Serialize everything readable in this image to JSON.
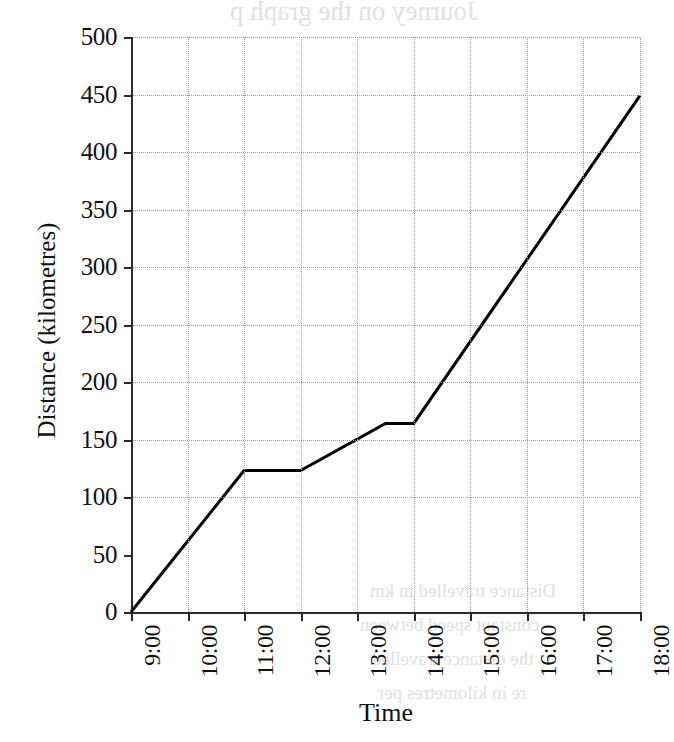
{
  "chart_data": {
    "type": "line",
    "title": "",
    "xlabel": "Time",
    "ylabel": "Distance (kilometres)",
    "xlim": [
      9,
      18
    ],
    "ylim": [
      0,
      500
    ],
    "grid": true,
    "legend": false,
    "x_tick_labels": [
      "9:00",
      "10:00",
      "11:00",
      "12:00",
      "13:00",
      "14:00",
      "15:00",
      "16:00",
      "17:00",
      "18:00"
    ],
    "x_tick_values": [
      9,
      10,
      11,
      12,
      13,
      14,
      15,
      16,
      17,
      18
    ],
    "y_tick_labels": [
      "0",
      "50",
      "100",
      "150",
      "200",
      "250",
      "300",
      "350",
      "400",
      "450",
      "500"
    ],
    "y_tick_values": [
      0,
      50,
      100,
      150,
      200,
      250,
      300,
      350,
      400,
      450,
      500
    ],
    "y_gridline_values": [
      100,
      150,
      200,
      250,
      300,
      350,
      400,
      450,
      500
    ],
    "series": [
      {
        "name": "Journey",
        "color": "#000000",
        "line_width": 3,
        "points": [
          {
            "x": 9.0,
            "label": "9:00",
            "y": 0
          },
          {
            "x": 11.0,
            "label": "11:00",
            "y": 123
          },
          {
            "x": 12.0,
            "label": "12:00",
            "y": 123
          },
          {
            "x": 13.5,
            "label": "13:30",
            "y": 164
          },
          {
            "x": 14.0,
            "label": "14:00",
            "y": 164
          },
          {
            "x": 18.0,
            "label": "18:00",
            "y": 449
          }
        ]
      }
    ]
  },
  "bleed_text": {
    "top": "Journey on the graph p",
    "line1": "Distance travelled in km",
    "line2": "constant speed between",
    "line3": "the distance travelled",
    "line4": "re in kilometres per"
  },
  "colors": {
    "axis": "#2a2a2a",
    "grid": "#9a9a9a",
    "series": "#000000",
    "background": "#ffffff"
  }
}
